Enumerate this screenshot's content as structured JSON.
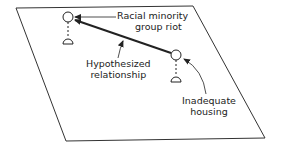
{
  "diagram": {
    "nodes": [
      {
        "id": "riot",
        "label_line1": "Racial minority",
        "label_line2": "group riot"
      },
      {
        "id": "housing",
        "label_line1": "Inadequate",
        "label_line2": "housing"
      }
    ],
    "edge": {
      "from": "housing",
      "to": "riot",
      "label_line1": "Hypothesized",
      "label_line2": "relationship"
    },
    "colors": {
      "line": "#222222",
      "background": "#ffffff"
    }
  }
}
